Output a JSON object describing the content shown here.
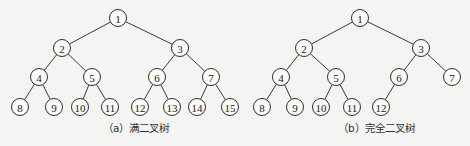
{
  "figures": [
    {
      "id": "a",
      "caption": "（a）满二叉树",
      "caption_x": 103,
      "nodes": [
        {
          "label": "1",
          "x": 118,
          "y": 18
        },
        {
          "label": "2",
          "x": 62,
          "y": 48
        },
        {
          "label": "3",
          "x": 180,
          "y": 48
        },
        {
          "label": "4",
          "x": 39,
          "y": 77
        },
        {
          "label": "5",
          "x": 92,
          "y": 77
        },
        {
          "label": "6",
          "x": 157,
          "y": 77
        },
        {
          "label": "7",
          "x": 211,
          "y": 77
        },
        {
          "label": "8",
          "x": 20,
          "y": 107
        },
        {
          "label": "9",
          "x": 54,
          "y": 107
        },
        {
          "label": "10",
          "x": 80,
          "y": 107
        },
        {
          "label": "11",
          "x": 110,
          "y": 107
        },
        {
          "label": "12",
          "x": 140,
          "y": 107
        },
        {
          "label": "13",
          "x": 172,
          "y": 107
        },
        {
          "label": "14",
          "x": 197,
          "y": 107
        },
        {
          "label": "15",
          "x": 230,
          "y": 107
        }
      ],
      "edges": [
        [
          0,
          1
        ],
        [
          0,
          2
        ],
        [
          1,
          3
        ],
        [
          1,
          4
        ],
        [
          2,
          5
        ],
        [
          2,
          6
        ],
        [
          3,
          7
        ],
        [
          3,
          8
        ],
        [
          4,
          9
        ],
        [
          4,
          10
        ],
        [
          5,
          11
        ],
        [
          5,
          12
        ],
        [
          6,
          13
        ],
        [
          6,
          14
        ]
      ]
    },
    {
      "id": "b",
      "caption": "（b）完全二叉树",
      "caption_x": 338,
      "nodes": [
        {
          "label": "1",
          "x": 360,
          "y": 18
        },
        {
          "label": "2",
          "x": 304,
          "y": 48
        },
        {
          "label": "3",
          "x": 421,
          "y": 48
        },
        {
          "label": "4",
          "x": 281,
          "y": 77
        },
        {
          "label": "5",
          "x": 336,
          "y": 77
        },
        {
          "label": "6",
          "x": 399,
          "y": 77
        },
        {
          "label": "7",
          "x": 452,
          "y": 77
        },
        {
          "label": "8",
          "x": 262,
          "y": 107
        },
        {
          "label": "9",
          "x": 295,
          "y": 107
        },
        {
          "label": "10",
          "x": 321,
          "y": 107
        },
        {
          "label": "11",
          "x": 352,
          "y": 107
        },
        {
          "label": "12",
          "x": 381,
          "y": 107
        }
      ],
      "edges": [
        [
          0,
          1
        ],
        [
          0,
          2
        ],
        [
          1,
          3
        ],
        [
          1,
          4
        ],
        [
          2,
          5
        ],
        [
          2,
          6
        ],
        [
          3,
          7
        ],
        [
          3,
          8
        ],
        [
          4,
          9
        ],
        [
          4,
          10
        ],
        [
          5,
          11
        ]
      ]
    }
  ],
  "node_radius": 8.5
}
